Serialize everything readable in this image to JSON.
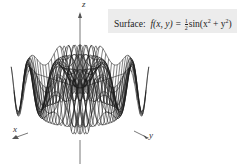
{
  "caption": {
    "prefix": "Surface:",
    "function_lhs": "f(x, y) =",
    "frac_num": "1",
    "frac_den": "2",
    "function_rhs_pre": "sin(x",
    "exp1": "2",
    "plus": " + y",
    "exp2": "2",
    "close": ")"
  },
  "axes": {
    "x": "x",
    "y": "y",
    "z": "z"
  },
  "chart_data": {
    "type": "surface-wireframe",
    "function": "0.5*sin(x^2+y^2)",
    "x_range": [
      -2.6,
      2.6
    ],
    "y_range": [
      -2.6,
      2.6
    ],
    "grid_lines": 25,
    "axis_labels": [
      "x",
      "y",
      "z"
    ],
    "colors": {
      "mesh": "#1a1a1a",
      "axis": "#555555",
      "label_bg": "#ececec"
    }
  }
}
